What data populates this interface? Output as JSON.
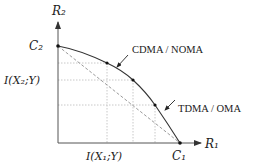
{
  "diagram": {
    "type": "capacity-region",
    "axes": {
      "x_label": "R₁",
      "y_label": "R₂"
    },
    "ticks": {
      "c1": "C₁",
      "c2": "C₂",
      "i_x1": "I(X₁;Y)",
      "i_x2": "I(X₂;Y)"
    },
    "annotations": {
      "cdma": "CDMA / NOMA",
      "tdma": "TDMA / OMA"
    },
    "colors": {
      "axis": "#555555",
      "curve": "#333333",
      "dashed": "#9a9a9a",
      "grid": "#c8c8c8",
      "point": "#111111"
    }
  }
}
